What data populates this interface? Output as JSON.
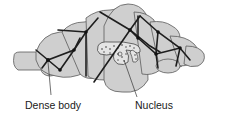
{
  "diagram": {
    "colors": {
      "cell_fill": "#cfcfcf",
      "cell_outline": "#555555",
      "filament": "#1e1e1e",
      "nucleus_fill": "#e4e4e4",
      "label_text": "#1a1a1a"
    },
    "labels": [
      {
        "id": "dense-body",
        "text": "Dense body"
      },
      {
        "id": "nucleus",
        "text": "Nucleus"
      }
    ]
  }
}
